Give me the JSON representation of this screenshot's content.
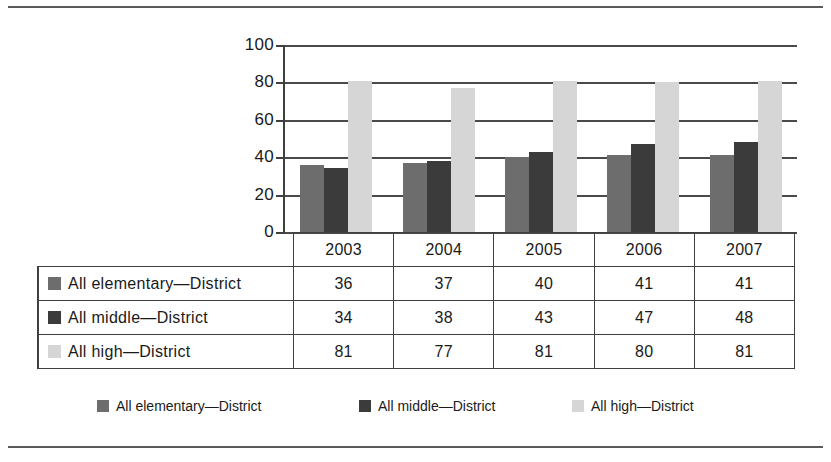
{
  "chart_data": {
    "type": "bar",
    "title": "",
    "subtitle": "",
    "xlabel": "",
    "ylabel": "",
    "categories": [
      "2003",
      "2004",
      "2005",
      "2006",
      "2007"
    ],
    "series": [
      {
        "name": "All elementary—District",
        "values": [
          36,
          37,
          40,
          41,
          41
        ],
        "color": "#6d6d6d"
      },
      {
        "name": "All middle—District",
        "values": [
          34,
          38,
          43,
          47,
          48
        ],
        "color": "#3b3b3b"
      },
      {
        "name": "All high—District",
        "values": [
          81,
          77,
          81,
          80,
          81
        ],
        "color": "#d6d6d6"
      }
    ],
    "ylim": [
      0,
      100
    ],
    "yticks": [
      0,
      20,
      40,
      60,
      80,
      100
    ],
    "ytick_labels": [
      "0",
      "20",
      "40",
      "60",
      "80",
      "100"
    ],
    "grid": true,
    "grid_axis": "y",
    "legend_position": "bottom",
    "data_table": true
  },
  "table": {
    "year_header": [
      "2003",
      "2004",
      "2005",
      "2006",
      "2007"
    ],
    "rows": [
      {
        "label": "All elementary—District",
        "swatch": "elementary",
        "values": [
          "36",
          "37",
          "40",
          "41",
          "41"
        ]
      },
      {
        "label": "All middle—District",
        "swatch": "middle",
        "values": [
          "34",
          "38",
          "43",
          "47",
          "48"
        ]
      },
      {
        "label": "All high—District",
        "swatch": "high",
        "values": [
          "81",
          "77",
          "81",
          "80",
          "81"
        ]
      }
    ]
  },
  "legend": {
    "items": [
      {
        "label": "All elementary—District",
        "swatch": "elementary"
      },
      {
        "label": "All middle—District",
        "swatch": "middle"
      },
      {
        "label": "All high—District",
        "swatch": "high"
      }
    ]
  },
  "colors": {
    "elementary": "#6d6d6d",
    "middle": "#3b3b3b",
    "high": "#d6d6d6",
    "axis": "#3f3f3f",
    "rule": "#5a5a5a"
  }
}
